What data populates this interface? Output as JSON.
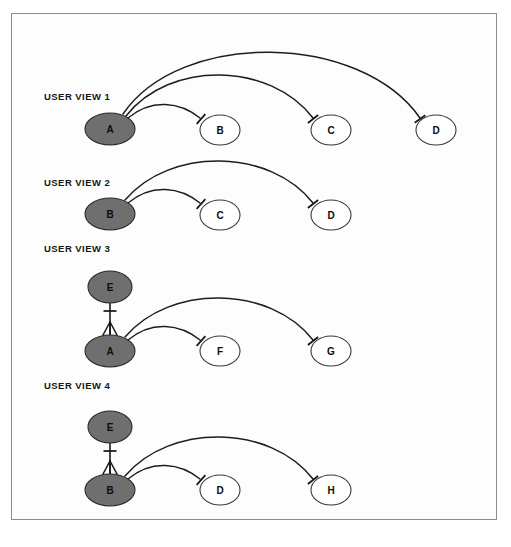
{
  "page": {
    "width": 511,
    "height": 547,
    "background_color": "#ffffff",
    "frame_color": "#8a8a8a",
    "canvas_color": "#fdfdfd"
  },
  "style": {
    "filled_node_fill": "#6f6f6f",
    "filled_node_stroke": "#2a2a2a",
    "open_node_fill": "#ffffff",
    "open_node_stroke": "#3a3a3a",
    "edge_color": "#1d1d1d",
    "label_color": "#161616"
  },
  "legend_notation": {
    "tick": "one-cardinality-tick",
    "crow_foot": "many-cardinality-crowsfoot"
  },
  "views": [
    {
      "id": "view-1",
      "label": "USER VIEW 1",
      "label_x": 44,
      "label_y": 100,
      "nodes": [
        {
          "id": "v1-a",
          "text": "A",
          "cx": 110,
          "cy": 129,
          "rx": 25,
          "ry": 16,
          "filled": true
        },
        {
          "id": "v1-b",
          "text": "B",
          "cx": 220,
          "cy": 130,
          "rx": 20,
          "ry": 15,
          "filled": false
        },
        {
          "id": "v1-c",
          "text": "C",
          "cx": 331,
          "cy": 130,
          "rx": 20,
          "ry": 15,
          "filled": false
        },
        {
          "id": "v1-d",
          "text": "D",
          "cx": 436,
          "cy": 130,
          "rx": 20,
          "ry": 15,
          "filled": false
        }
      ],
      "edges": [
        {
          "id": "v1-a-b",
          "from": "A",
          "to": "B",
          "path": "M 128 118 C 152 98, 180 102, 200 118",
          "tick": {
            "x": 201,
            "y": 119,
            "angle": 42
          },
          "source_cardinality": "many",
          "target_cardinality": "one"
        },
        {
          "id": "v1-a-c",
          "from": "A",
          "to": "C",
          "path": "M 126 116 C 170 60, 270 62, 313 118",
          "tick": {
            "x": 313,
            "y": 119,
            "angle": 52
          },
          "source_cardinality": "many",
          "target_cardinality": "one"
        },
        {
          "id": "v1-a-d",
          "from": "A",
          "to": "D",
          "path": "M 123 114 C 180 30, 360 32, 420 118",
          "tick": {
            "x": 420,
            "y": 119,
            "angle": 55
          },
          "source_cardinality": "many",
          "target_cardinality": "one"
        }
      ]
    },
    {
      "id": "view-2",
      "label": "USER VIEW 2",
      "label_x": 44,
      "label_y": 186,
      "nodes": [
        {
          "id": "v2-b",
          "text": "B",
          "cx": 110,
          "cy": 214,
          "rx": 25,
          "ry": 16,
          "filled": true
        },
        {
          "id": "v2-c",
          "text": "C",
          "cx": 220,
          "cy": 215,
          "rx": 20,
          "ry": 15,
          "filled": false
        },
        {
          "id": "v2-d",
          "text": "D",
          "cx": 331,
          "cy": 215,
          "rx": 20,
          "ry": 15,
          "filled": false
        }
      ],
      "edges": [
        {
          "id": "v2-b-c",
          "from": "B",
          "to": "C",
          "path": "M 128 203 C 152 183, 180 187, 200 203",
          "tick": {
            "x": 201,
            "y": 204,
            "angle": 42
          },
          "source_cardinality": "many",
          "target_cardinality": "one"
        },
        {
          "id": "v2-b-d",
          "from": "B",
          "to": "D",
          "path": "M 125 200 C 170 147, 270 148, 313 203",
          "tick": {
            "x": 313,
            "y": 204,
            "angle": 52
          },
          "source_cardinality": "many",
          "target_cardinality": "one"
        }
      ]
    },
    {
      "id": "view-3",
      "label": "USER VIEW 3",
      "label_x": 44,
      "label_y": 252,
      "nodes": [
        {
          "id": "v3-e",
          "text": "E",
          "cx": 110,
          "cy": 287,
          "rx": 22,
          "ry": 16,
          "filled": true
        },
        {
          "id": "v3-a",
          "text": "A",
          "cx": 110,
          "cy": 351,
          "rx": 25,
          "ry": 16,
          "filled": true
        },
        {
          "id": "v3-f",
          "text": "F",
          "cx": 220,
          "cy": 351,
          "rx": 20,
          "ry": 15,
          "filled": false
        },
        {
          "id": "v3-g",
          "text": "G",
          "cx": 331,
          "cy": 351,
          "rx": 20,
          "ry": 15,
          "filled": false
        }
      ],
      "edges": [
        {
          "id": "v3-e-a",
          "from": "E",
          "to": "A",
          "straight": {
            "x1": 110,
            "y1": 303,
            "x2": 110,
            "y2": 335
          },
          "tick": {
            "x": 110,
            "y": 311,
            "angle": 90
          },
          "crow_foot": {
            "x": 110,
            "y": 335,
            "direction": "up"
          },
          "source_cardinality": "one",
          "target_cardinality": "many"
        },
        {
          "id": "v3-a-f",
          "from": "A",
          "to": "F",
          "path": "M 128 340 C 152 320, 180 324, 200 340",
          "tick": {
            "x": 201,
            "y": 341,
            "angle": 42
          },
          "source_cardinality": "many",
          "target_cardinality": "one"
        },
        {
          "id": "v3-a-g",
          "from": "A",
          "to": "G",
          "path": "M 125 337 C 170 284, 270 285, 313 340",
          "tick": {
            "x": 313,
            "y": 341,
            "angle": 52
          },
          "source_cardinality": "many",
          "target_cardinality": "one"
        }
      ]
    },
    {
      "id": "view-4",
      "label": "USER VIEW 4",
      "label_x": 44,
      "label_y": 389,
      "nodes": [
        {
          "id": "v4-e",
          "text": "E",
          "cx": 110,
          "cy": 427,
          "rx": 22,
          "ry": 16,
          "filled": true
        },
        {
          "id": "v4-b",
          "text": "B",
          "cx": 110,
          "cy": 490,
          "rx": 25,
          "ry": 16,
          "filled": true
        },
        {
          "id": "v4-d",
          "text": "D",
          "cx": 220,
          "cy": 490,
          "rx": 20,
          "ry": 15,
          "filled": false
        },
        {
          "id": "v4-h",
          "text": "H",
          "cx": 331,
          "cy": 490,
          "rx": 20,
          "ry": 15,
          "filled": false
        }
      ],
      "edges": [
        {
          "id": "v4-e-b",
          "from": "E",
          "to": "B",
          "straight": {
            "x1": 110,
            "y1": 443,
            "x2": 110,
            "y2": 474
          },
          "tick": {
            "x": 110,
            "y": 451,
            "angle": 90
          },
          "crow_foot": {
            "x": 110,
            "y": 474,
            "direction": "up"
          },
          "source_cardinality": "one",
          "target_cardinality": "many"
        },
        {
          "id": "v4-b-d",
          "from": "B",
          "to": "D",
          "path": "M 128 479 C 152 459, 180 463, 200 479",
          "tick": {
            "x": 201,
            "y": 480,
            "angle": 42
          },
          "source_cardinality": "many",
          "target_cardinality": "one"
        },
        {
          "id": "v4-b-h",
          "from": "B",
          "to": "H",
          "path": "M 125 476 C 170 423, 270 424, 313 479",
          "tick": {
            "x": 313,
            "y": 480,
            "angle": 52
          },
          "source_cardinality": "many",
          "target_cardinality": "one"
        }
      ]
    }
  ]
}
